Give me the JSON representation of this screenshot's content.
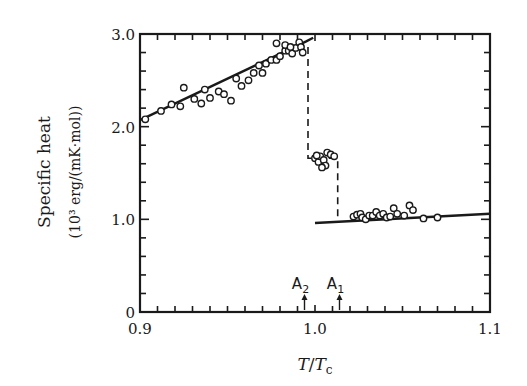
{
  "chart_data": {
    "type": "scatter",
    "title": "",
    "xlabel": "T/Tc",
    "ylabel": "Specific heat",
    "ylabel_units": "(10³ erg/(mK·mol))",
    "xlim": [
      0.9,
      1.1
    ],
    "ylim": [
      0,
      3.0
    ],
    "x_ticks": [
      "0.9",
      "1.0",
      "1.1"
    ],
    "y_ticks": [
      "0",
      "1.0",
      "2.0",
      "3.0"
    ],
    "grid": false,
    "legend": null,
    "annotations": [
      {
        "label": "A2",
        "x": 0.994
      },
      {
        "label": "A1",
        "x": 1.014
      }
    ],
    "series": [
      {
        "name": "measured",
        "kind": "scatter-open-circles",
        "points": [
          [
            0.903,
            2.08
          ],
          [
            0.912,
            2.17
          ],
          [
            0.918,
            2.24
          ],
          [
            0.923,
            2.22
          ],
          [
            0.925,
            2.42
          ],
          [
            0.931,
            2.3
          ],
          [
            0.935,
            2.25
          ],
          [
            0.937,
            2.4
          ],
          [
            0.94,
            2.31
          ],
          [
            0.945,
            2.38
          ],
          [
            0.948,
            2.35
          ],
          [
            0.952,
            2.28
          ],
          [
            0.955,
            2.52
          ],
          [
            0.958,
            2.44
          ],
          [
            0.962,
            2.5
          ],
          [
            0.965,
            2.58
          ],
          [
            0.968,
            2.66
          ],
          [
            0.97,
            2.58
          ],
          [
            0.972,
            2.68
          ],
          [
            0.975,
            2.72
          ],
          [
            0.978,
            2.72
          ],
          [
            0.98,
            2.76
          ],
          [
            0.983,
            2.82
          ],
          [
            0.985,
            2.82
          ],
          [
            0.987,
            2.79
          ],
          [
            0.989,
            2.85
          ],
          [
            0.991,
            2.91
          ],
          [
            0.992,
            2.86
          ],
          [
            0.993,
            2.8
          ],
          [
            0.978,
            2.9
          ],
          [
            0.983,
            2.88
          ],
          [
            0.986,
            2.86
          ],
          [
            1.0,
            1.66
          ],
          [
            1.002,
            1.62
          ],
          [
            1.003,
            1.68
          ],
          [
            1.005,
            1.64
          ],
          [
            1.006,
            1.58
          ],
          [
            1.007,
            1.72
          ],
          [
            1.009,
            1.7
          ],
          [
            1.011,
            1.68
          ],
          [
            1.004,
            1.56
          ],
          [
            1.001,
            1.69
          ],
          [
            1.022,
            1.03
          ],
          [
            1.024,
            1.05
          ],
          [
            1.026,
            1.06
          ],
          [
            1.027,
            1.02
          ],
          [
            1.029,
            1.0
          ],
          [
            1.031,
            1.04
          ],
          [
            1.033,
            1.04
          ],
          [
            1.035,
            1.08
          ],
          [
            1.037,
            1.04
          ],
          [
            1.039,
            1.06
          ],
          [
            1.041,
            1.02
          ],
          [
            1.043,
            1.03
          ],
          [
            1.045,
            1.12
          ],
          [
            1.047,
            1.06
          ],
          [
            1.051,
            1.04
          ],
          [
            1.054,
            1.15
          ],
          [
            1.056,
            1.1
          ],
          [
            1.062,
            1.01
          ],
          [
            1.07,
            1.02
          ]
        ]
      },
      {
        "name": "fit below transition",
        "kind": "line",
        "points": [
          [
            0.9,
            2.07
          ],
          [
            0.995,
            2.92
          ],
          [
            0.999,
            2.96
          ]
        ]
      },
      {
        "name": "step (A2)",
        "kind": "dashed",
        "points": [
          [
            0.996,
            2.86
          ],
          [
            0.996,
            1.66
          ],
          [
            1.013,
            1.66
          ],
          [
            1.013,
            0.97
          ]
        ]
      },
      {
        "name": "fit above transition",
        "kind": "line",
        "points": [
          [
            1.0,
            0.96
          ],
          [
            1.1,
            1.06
          ]
        ]
      }
    ]
  }
}
